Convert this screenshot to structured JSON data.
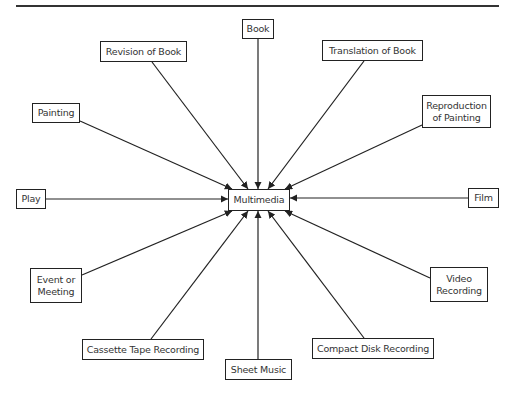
{
  "diagram": {
    "center": {
      "id": "multimedia",
      "label": "Multimedia"
    },
    "sources": [
      {
        "id": "book",
        "label": "Book"
      },
      {
        "id": "revision",
        "label": "Revision of Book"
      },
      {
        "id": "translation",
        "label": "Translation of Book"
      },
      {
        "id": "painting",
        "label": "Painting"
      },
      {
        "id": "reproduction",
        "label": "Reproduction\nof Painting"
      },
      {
        "id": "play",
        "label": "Play"
      },
      {
        "id": "film",
        "label": "Film"
      },
      {
        "id": "event",
        "label": "Event or\nMeeting"
      },
      {
        "id": "video",
        "label": "Video\nRecording"
      },
      {
        "id": "cassette",
        "label": "Cassette Tape Recording"
      },
      {
        "id": "sheet",
        "label": "Sheet Music"
      },
      {
        "id": "compact",
        "label": "Compact Disk Recording"
      }
    ],
    "edges": [
      {
        "from": "book",
        "to": "multimedia"
      },
      {
        "from": "revision",
        "to": "multimedia"
      },
      {
        "from": "translation",
        "to": "multimedia"
      },
      {
        "from": "painting",
        "to": "multimedia"
      },
      {
        "from": "reproduction",
        "to": "multimedia"
      },
      {
        "from": "play",
        "to": "multimedia"
      },
      {
        "from": "film",
        "to": "multimedia"
      },
      {
        "from": "event",
        "to": "multimedia"
      },
      {
        "from": "video",
        "to": "multimedia"
      },
      {
        "from": "cassette",
        "to": "multimedia"
      },
      {
        "from": "sheet",
        "to": "multimedia"
      },
      {
        "from": "compact",
        "to": "multimedia"
      }
    ]
  }
}
